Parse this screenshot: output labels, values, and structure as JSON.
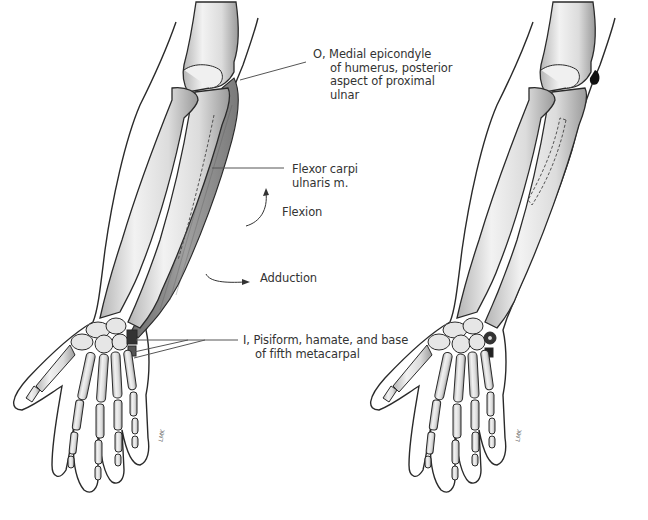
{
  "figure": {
    "panels": [
      {
        "id": "left",
        "content": "forearm with flexor carpi ulnaris muscle shaded",
        "artist_signature": "LMK"
      },
      {
        "id": "right",
        "content": "forearm bones showing origin (dark mark at medial epicondyle, dashed outline on ulna) and insertion points on pisiform, hamate, fifth metacarpal",
        "artist_signature": "LMK"
      }
    ],
    "labels": {
      "origin": {
        "line1": "O, Medial epicondyle",
        "line2": "of humerus, posterior",
        "line3": "aspect of proximal",
        "line4": "ulnar"
      },
      "muscle": {
        "line1": "Flexor carpi",
        "line2": "ulnaris m."
      },
      "flexion": "Flexion",
      "adduction": "Adduction",
      "insertion": {
        "line1": "I, Pisiform, hamate, and base",
        "line2": "of fifth metacarpal"
      }
    },
    "colors": {
      "bone_fill": "#e8e8e8",
      "bone_shade": "#a8a8a8",
      "outline": "#2a2a2a",
      "muscle": "#8c8c8c",
      "attachment_mark": "#111111",
      "leader_line": "#555555"
    }
  }
}
